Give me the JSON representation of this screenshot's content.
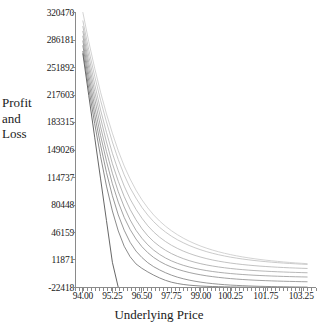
{
  "chart_data": {
    "type": "line",
    "title": "",
    "xlabel": "Underlying Price",
    "ylabel": "Profit\nand\nLoss",
    "xlim": [
      93.6875,
      103.875
    ],
    "ylim": [
      -22418,
      320470
    ],
    "grid": false,
    "legend": "none",
    "xticks": [
      "94.00",
      "95.25",
      "96.50",
      "97.75",
      "99.00",
      "100.25",
      "101.75",
      "103.25"
    ],
    "xtick_values": [
      94.0,
      95.25,
      96.5,
      97.75,
      99.0,
      100.25,
      101.75,
      103.25
    ],
    "yticks": [
      "320470",
      "286181",
      "251892",
      "217603",
      "183315",
      "149026",
      "114737",
      "80448",
      "46159",
      "11871",
      "-22418"
    ],
    "ytick_values": [
      320470,
      286181,
      251892,
      217603,
      183315,
      149026,
      114737,
      80448,
      46159,
      11871,
      -22418
    ],
    "x": [
      94.0,
      94.25,
      94.5,
      94.75,
      95.0,
      95.25,
      95.5,
      95.75,
      96.0,
      96.25,
      96.5,
      96.75,
      97.0,
      97.25,
      97.5,
      97.75,
      98.0,
      98.25,
      98.5,
      98.75,
      99.0,
      99.25,
      99.5,
      99.75,
      100.0,
      100.25,
      100.5,
      100.75,
      101.0,
      101.25,
      101.5,
      101.75,
      102.0,
      102.25,
      102.5,
      102.75,
      103.0,
      103.25,
      103.5
    ],
    "series": [
      {
        "name": "expiry",
        "values": [
          269000,
          217000,
          165000,
          113000,
          61000,
          9000,
          -22418,
          -22418,
          -22418,
          -22418,
          -22418,
          -22418,
          -22418,
          -22418,
          -22418,
          -22418,
          -22418,
          -22418,
          -22418,
          -22418,
          -22418,
          -22418,
          -22418,
          -22418,
          -22418,
          -22418,
          -22418,
          -22418,
          -22418,
          -22418,
          -22418,
          -22418,
          -22418,
          -22418,
          -22418,
          -22418,
          -22418,
          -22418,
          -22418
        ]
      },
      {
        "name": "t1",
        "values": [
          272000,
          226000,
          182000,
          141000,
          104000,
          73000,
          48000,
          29000,
          16000,
          7000,
          1500,
          -3000,
          -7000,
          -10500,
          -13500,
          -15800,
          -17400,
          -18600,
          -19500,
          -20100,
          -20600,
          -20950,
          -21200,
          -21400,
          -21600,
          -21750,
          -21850,
          -21950,
          -22020,
          -22080,
          -22130,
          -22180,
          -22220,
          -22250,
          -22280,
          -22310,
          -22330,
          -22350,
          -22370
        ]
      },
      {
        "name": "t2",
        "values": [
          279000,
          235000,
          193000,
          155000,
          121000,
          92000,
          68000,
          49000,
          34000,
          23000,
          15000,
          8500,
          3500,
          -500,
          -4000,
          -7000,
          -9500,
          -11500,
          -13200,
          -14600,
          -15800,
          -16800,
          -17600,
          -18300,
          -18900,
          -19400,
          -19800,
          -20150,
          -20450,
          -20700,
          -20920,
          -21100,
          -21260,
          -21400,
          -21520,
          -21630,
          -21720,
          -21800,
          -21870
        ]
      },
      {
        "name": "t3",
        "values": [
          285000,
          243000,
          203000,
          167000,
          135000,
          107000,
          84000,
          65000,
          50000,
          38000,
          28500,
          21000,
          15000,
          10200,
          6300,
          3100,
          400,
          -1800,
          -3700,
          -5300,
          -6700,
          -7900,
          -8900,
          -9800,
          -10600,
          -11300,
          -11900,
          -12400,
          -12850,
          -13250,
          -13600,
          -13900,
          -14170,
          -14410,
          -14620,
          -14810,
          -14980,
          -15130,
          -15260
        ]
      },
      {
        "name": "t4",
        "values": [
          291000,
          251000,
          213000,
          178000,
          147000,
          120000,
          97000,
          78000,
          62000,
          49000,
          39000,
          30800,
          24200,
          18800,
          14400,
          10800,
          7800,
          5300,
          3200,
          1400,
          -100,
          -1400,
          -2500,
          -3450,
          -4280,
          -5000,
          -5630,
          -6180,
          -6660,
          -7090,
          -7470,
          -7800,
          -8100,
          -8370,
          -8610,
          -8820,
          -9010,
          -9180,
          -9330
        ]
      },
      {
        "name": "t5",
        "values": [
          297000,
          258000,
          222000,
          189000,
          159000,
          132000,
          110000,
          91000,
          75000,
          62000,
          51000,
          42000,
          34800,
          28900,
          24000,
          19900,
          16500,
          13600,
          11100,
          9000,
          7200,
          5650,
          4320,
          3170,
          2170,
          1300,
          540,
          -130,
          -720,
          -1240,
          -1700,
          -2110,
          -2480,
          -2810,
          -3100,
          -3370,
          -3610,
          -3820,
          -4010
        ]
      },
      {
        "name": "t6",
        "values": [
          303000,
          266000,
          231000,
          199000,
          171000,
          145000,
          123000,
          104000,
          88000,
          75000,
          64000,
          54500,
          46800,
          40300,
          34900,
          30300,
          26400,
          23000,
          20100,
          17600,
          15400,
          13500,
          11850,
          10420,
          9170,
          8080,
          7120,
          6270,
          5520,
          4860,
          4270,
          3750,
          3280,
          2860,
          2490,
          2150,
          1850,
          1580,
          1340
        ]
      },
      {
        "name": "t7",
        "values": [
          310000,
          274000,
          241000,
          211000,
          184000,
          159000,
          137000,
          118000,
          102000,
          89000,
          77500,
          67800,
          59600,
          52600,
          46700,
          41600,
          37200,
          33400,
          30000,
          27100,
          24500,
          22200,
          20200,
          18430,
          16870,
          15480,
          14250,
          13150,
          12170,
          11290,
          10500,
          9790,
          9150,
          8570,
          8050,
          7570,
          7140,
          6740,
          6380
        ]
      },
      {
        "name": "t8",
        "values": [
          320470,
          284000,
          251000,
          221000,
          194000,
          170000,
          148000,
          129000,
          113000,
          99000,
          87000,
          76800,
          68000,
          60500,
          54000,
          48400,
          43500,
          39200,
          35400,
          32100,
          29100,
          26500,
          24170,
          22100,
          20250,
          18600,
          17120,
          15790,
          14600,
          13520,
          12540,
          11660,
          10850,
          10120,
          9450,
          8840,
          8280,
          7770,
          7300
        ]
      }
    ]
  },
  "style": {
    "axis_color": "#8a8a8a",
    "curve_dark": "#555555",
    "curve_light": "#cfcfcf",
    "background": "#ffffff"
  }
}
